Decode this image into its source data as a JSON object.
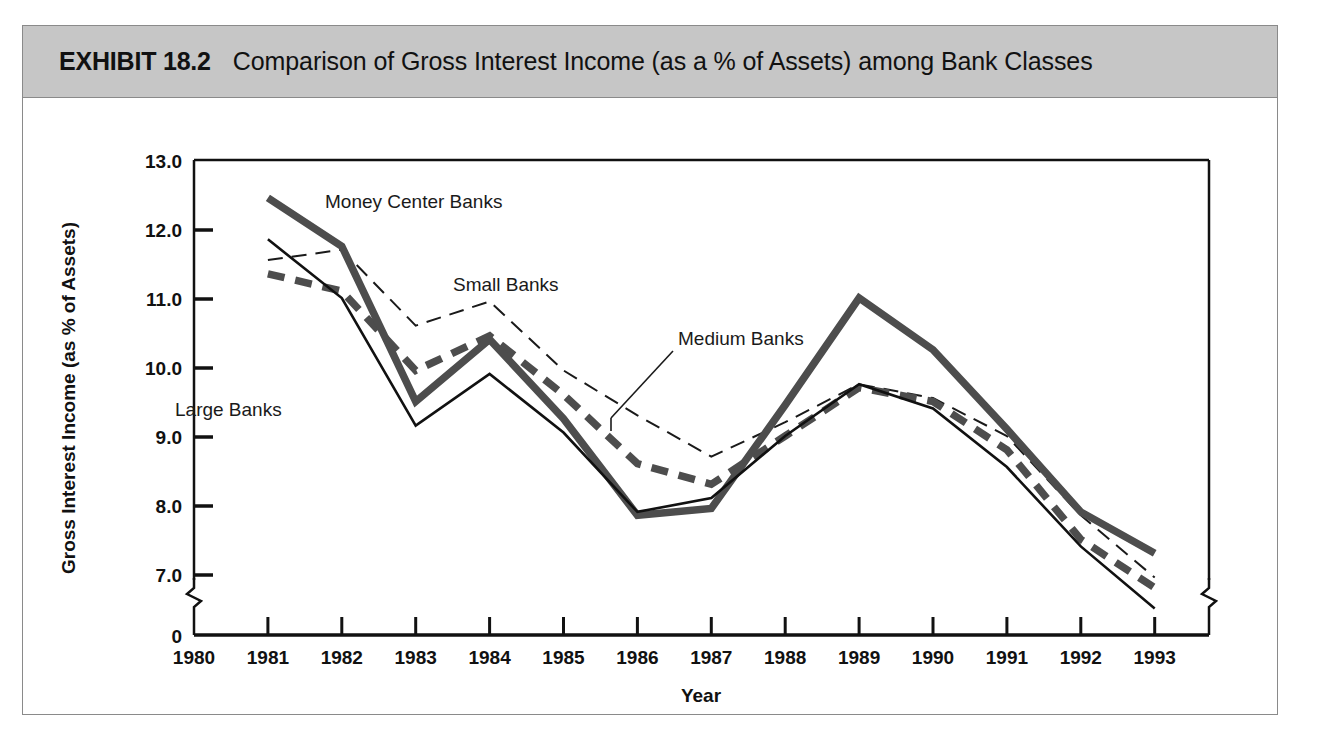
{
  "exhibit": {
    "label": "EXHIBIT 18.2",
    "title": "Comparison of Gross Interest Income (as a % of Assets) among Bank Classes",
    "header_bg": "#c6c6c6",
    "frame_border": "#8a8a8a"
  },
  "chart_data": {
    "type": "line",
    "title": "Comparison of Gross Interest Income (as a % of Assets) among Bank Classes",
    "xlabel": "Year",
    "ylabel": "Gross Interest Income (as % of Assets)",
    "x": [
      1981,
      1982,
      1983,
      1984,
      1985,
      1986,
      1987,
      1988,
      1989,
      1990,
      1991,
      1992,
      1993
    ],
    "xlim": [
      1980,
      1993
    ],
    "ylim": [
      6.3,
      13.0
    ],
    "axis_break": true,
    "zero_tick": "0",
    "grid": false,
    "legend_position": "inline-annotations",
    "xticks": [
      "1980",
      "1981",
      "1982",
      "1983",
      "1984",
      "1985",
      "1986",
      "1987",
      "1988",
      "1989",
      "1990",
      "1991",
      "1992",
      "1993"
    ],
    "yticks": [
      "13.0",
      "12.0",
      "11.0",
      "10.0",
      "9.0",
      "8.0",
      "7.0"
    ],
    "series": [
      {
        "name": "Money Center Banks",
        "style": "thick-solid",
        "color": "#4d4d4d",
        "values": [
          12.45,
          11.75,
          9.5,
          10.4,
          9.25,
          7.85,
          7.95,
          9.45,
          11.0,
          10.25,
          9.1,
          7.9,
          7.3
        ]
      },
      {
        "name": "Medium Banks",
        "style": "thick-dashed",
        "color": "#4d4d4d",
        "values": [
          11.35,
          11.1,
          9.95,
          10.45,
          9.6,
          8.6,
          8.3,
          9.0,
          9.7,
          9.5,
          8.8,
          7.5,
          6.8
        ]
      },
      {
        "name": "Small Banks",
        "style": "thin-dashed",
        "color": "#1a1a1a",
        "values": [
          11.55,
          11.7,
          10.6,
          10.95,
          9.95,
          9.3,
          8.7,
          9.2,
          9.75,
          9.55,
          9.0,
          7.85,
          6.95
        ]
      },
      {
        "name": "Large Banks",
        "style": "thin-solid",
        "color": "#111111",
        "values": [
          11.85,
          11.0,
          9.15,
          9.9,
          9.05,
          7.9,
          8.1,
          9.0,
          9.75,
          9.4,
          8.55,
          7.4,
          6.5
        ]
      }
    ],
    "annotations": [
      {
        "text": "Money Center Banks",
        "for": "Money Center Banks"
      },
      {
        "text": "Small Banks",
        "for": "Small Banks"
      },
      {
        "text": "Medium Banks",
        "for": "Medium Banks"
      },
      {
        "text": "Large Banks",
        "for": "Large Banks"
      }
    ]
  }
}
